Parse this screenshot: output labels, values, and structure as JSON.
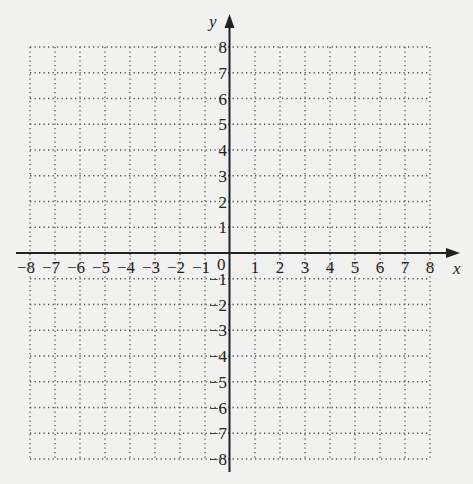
{
  "chart_data": {
    "type": "scatter",
    "title": "",
    "xlabel": "x",
    "ylabel": "y",
    "xlim": [
      -8,
      8
    ],
    "ylim": [
      -8,
      8
    ],
    "grid": true,
    "grid_style": "dotted",
    "x_ticks": [
      -8,
      -7,
      -6,
      -5,
      -4,
      -3,
      -2,
      -1,
      1,
      2,
      3,
      4,
      5,
      6,
      7,
      8
    ],
    "y_ticks": [
      -8,
      -7,
      -6,
      -5,
      -4,
      -3,
      -2,
      -1,
      1,
      2,
      3,
      4,
      5,
      6,
      7,
      8
    ],
    "x_tick_labels": [
      "−8",
      "−7",
      "−6",
      "−5",
      "−4",
      "−3",
      "−2",
      "−1",
      "1",
      "2",
      "3",
      "4",
      "5",
      "6",
      "7",
      "8"
    ],
    "y_tick_labels": [
      "−8",
      "−7",
      "−6",
      "−5",
      "−4",
      "−3",
      "−2",
      "−1",
      "1",
      "2",
      "3",
      "4",
      "5",
      "6",
      "7",
      "8"
    ],
    "origin_label": "0",
    "series": [],
    "legend": null
  },
  "colors": {
    "background": "#f1f1f0",
    "axis": "#222222",
    "grid": "#555555",
    "text": "#222222"
  }
}
